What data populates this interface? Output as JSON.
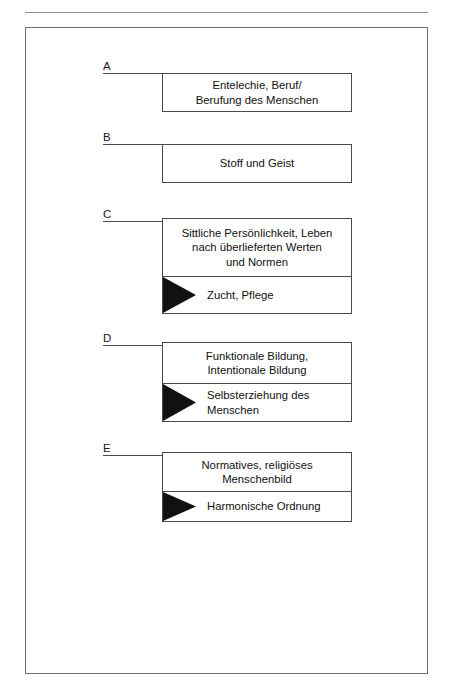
{
  "figure": {
    "background_color": "#ffffff",
    "frame_color": "#6f6f6f",
    "line_color": "#4a4a4a",
    "arrow_color": "#111111",
    "canvas": {
      "width": 453,
      "height": 696
    }
  },
  "groups": [
    {
      "label": "A",
      "rows": [
        {
          "text": "Entelechie, Beruf/\nBerufung des Menschen",
          "align": "center",
          "arrow": false
        }
      ]
    },
    {
      "label": "B",
      "rows": [
        {
          "text": "Stoff und Geist",
          "align": "center",
          "arrow": false
        }
      ]
    },
    {
      "label": "C",
      "rows": [
        {
          "text": "Sittliche Persönlichkeit, Leben\nnach überlieferten Werten\nund Normen",
          "align": "center",
          "arrow": false
        },
        {
          "text": "Zucht, Pflege",
          "align": "left",
          "arrow": true
        }
      ]
    },
    {
      "label": "D",
      "rows": [
        {
          "text": "Funktionale Bildung,\nIntentionale Bildung",
          "align": "center",
          "arrow": false
        },
        {
          "text": "Selbsterziehung des\nMenschen",
          "align": "left",
          "arrow": true
        }
      ]
    },
    {
      "label": "E",
      "rows": [
        {
          "text": "Normatives, religiöses\nMenschenbild",
          "align": "center",
          "arrow": false
        },
        {
          "text": "Harmonische Ordnung",
          "align": "left",
          "arrow": true
        }
      ]
    }
  ],
  "layout": {
    "box_left": 162,
    "box_width": 190,
    "label_left": 103,
    "leader_left": 103,
    "leader_width": 59,
    "groups": [
      {
        "label_top": 60,
        "leader_top": 73,
        "box_top": 73,
        "rows": [
          37
        ]
      },
      {
        "label_top": 131,
        "leader_top": 144,
        "box_top": 144,
        "rows": [
          37
        ]
      },
      {
        "label_top": 208,
        "leader_top": 221,
        "box_top": 218,
        "rows": [
          57,
          37
        ]
      },
      {
        "label_top": 332,
        "leader_top": 345,
        "box_top": 342,
        "rows": [
          40,
          38
        ]
      },
      {
        "label_top": 442,
        "leader_top": 455,
        "box_top": 452,
        "rows": [
          38,
          30
        ]
      }
    ]
  }
}
